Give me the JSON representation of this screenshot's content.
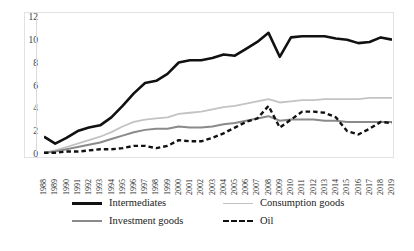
{
  "chart_data": {
    "type": "line",
    "title": "",
    "subtitle": "",
    "xlabel": "",
    "ylabel": "",
    "xlim": [
      1988,
      2019
    ],
    "ylim": [
      0,
      12
    ],
    "ytick_step": 2,
    "grid": false,
    "legend_position": "bottom",
    "categories": [
      "1988",
      "1989",
      "1990",
      "1991",
      "1992",
      "1993",
      "1994",
      "1995",
      "1996",
      "1997",
      "1998",
      "1999",
      "2000",
      "2001",
      "2002",
      "2003",
      "2004",
      "2005",
      "2006",
      "2007",
      "2008",
      "2009",
      "2010",
      "2011",
      "2012",
      "2013",
      "2014",
      "2015",
      "2016",
      "2017",
      "2018",
      "2019"
    ],
    "yticks": [
      "0",
      "2",
      "4",
      "6",
      "8",
      "10",
      "12"
    ],
    "series": [
      {
        "name": "Intermediates",
        "color": "#111111",
        "style": "solid",
        "width": 2.6,
        "values": [
          1.6,
          1.0,
          1.5,
          2.1,
          2.4,
          2.6,
          3.3,
          4.3,
          5.4,
          6.3,
          6.5,
          7.1,
          8.1,
          8.3,
          8.3,
          8.5,
          8.8,
          8.7,
          9.3,
          9.9,
          10.7,
          8.6,
          10.3,
          10.4,
          10.4,
          10.4,
          10.2,
          10.1,
          9.8,
          9.9,
          10.3,
          10.1
        ]
      },
      {
        "name": "Consumption goods",
        "color": "#c3c3c3",
        "style": "solid",
        "width": 1.8,
        "values": [
          0.2,
          0.4,
          0.7,
          1.0,
          1.3,
          1.6,
          2.0,
          2.5,
          2.9,
          3.1,
          3.2,
          3.3,
          3.6,
          3.7,
          3.8,
          4.0,
          4.2,
          4.3,
          4.5,
          4.7,
          4.9,
          4.6,
          4.7,
          4.8,
          4.8,
          4.9,
          4.9,
          4.9,
          4.9,
          5.0,
          5.0,
          5.0
        ]
      },
      {
        "name": "Investment goods",
        "color": "#8a8a8a",
        "style": "solid",
        "width": 2.0,
        "values": [
          0.2,
          0.3,
          0.5,
          0.7,
          0.9,
          1.1,
          1.4,
          1.7,
          2.0,
          2.2,
          2.3,
          2.3,
          2.5,
          2.4,
          2.4,
          2.5,
          2.7,
          2.8,
          3.0,
          3.2,
          3.4,
          3.0,
          3.1,
          3.1,
          3.1,
          3.0,
          3.0,
          2.9,
          2.9,
          2.9,
          2.9,
          2.9
        ]
      },
      {
        "name": "Oil",
        "color": "#111111",
        "style": "dashed",
        "width": 2.4,
        "values": [
          0.2,
          0.2,
          0.3,
          0.3,
          0.4,
          0.5,
          0.5,
          0.6,
          0.8,
          0.8,
          0.6,
          0.8,
          1.3,
          1.2,
          1.2,
          1.5,
          1.9,
          2.4,
          2.9,
          3.2,
          4.3,
          2.4,
          3.1,
          3.8,
          3.8,
          3.7,
          3.3,
          2.1,
          1.8,
          2.3,
          2.9,
          2.8
        ]
      }
    ]
  },
  "legend": {
    "items": [
      {
        "label": "Intermediates"
      },
      {
        "label": "Consumption goods"
      },
      {
        "label": "Investment goods"
      },
      {
        "label": "Oil"
      }
    ]
  }
}
